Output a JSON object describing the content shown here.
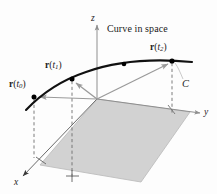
{
  "figure": {
    "title_text": "Curve in space",
    "curve_label": "C",
    "axes": {
      "z_label": "z",
      "y_label": "y",
      "x_label": "x"
    },
    "vectors": [
      {
        "name": "r-t0",
        "bold": "r",
        "open_paren": "(",
        "var": "t",
        "sub": "0",
        "close_paren": ")",
        "label": "r(t0)"
      },
      {
        "name": "r-t1",
        "bold": "r",
        "open_paren": "(",
        "var": "t",
        "sub": "1",
        "close_paren": ")",
        "label": "r(t1)"
      },
      {
        "name": "r-t2",
        "bold": "r",
        "open_paren": "(",
        "var": "t",
        "sub": "2",
        "close_paren": ")",
        "label": "r(t2)"
      }
    ],
    "colors": {
      "curve": "#111111",
      "vector": "#9a9a9a",
      "axis": "#8f8f8f",
      "plane_fill": "#d2d2d2",
      "plane_stroke": "#b4b4b4",
      "dashed": "#6d6d6d",
      "point": "#000000",
      "background": "#fdfdfd"
    },
    "geometry": {
      "origin": [
        97,
        99
      ],
      "points": [
        {
          "name": "point-t0",
          "x": 34,
          "y": 97,
          "foot_x": 34,
          "foot_y": 157
        },
        {
          "name": "point-t1",
          "x": 72,
          "y": 79,
          "foot_x": 72,
          "foot_y": 175
        },
        {
          "name": "point-mid",
          "x": 124,
          "y": 65,
          "foot_x": null,
          "foot_y": null
        },
        {
          "name": "point-t2",
          "x": 172,
          "y": 61,
          "foot_x": 172,
          "foot_y": 113
        }
      ]
    }
  }
}
